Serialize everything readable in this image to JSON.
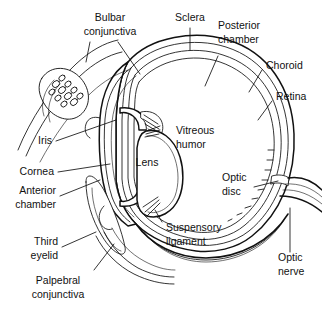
{
  "figure": {
    "type": "anatomical-line-diagram",
    "background_color": "#ffffff",
    "line_color": "#111111",
    "text_color": "#111111"
  },
  "labels": {
    "bulbar_conjunctiva_l1": "Bulbar",
    "bulbar_conjunctiva_l2": "conjunctiva",
    "sclera": "Sclera",
    "posterior_chamber_l1": "Posterior",
    "posterior_chamber_l2": "chamber",
    "choroid": "Choroid",
    "retina": "Retina",
    "iris": "Iris",
    "vitreous_humor_l1": "Vitreous",
    "vitreous_humor_l2": "humor",
    "lens": "Lens",
    "cornea": "Cornea",
    "anterior_chamber_l1": "Anterior",
    "anterior_chamber_l2": "chamber",
    "optic_disc_l1": "Optic",
    "optic_disc_l2": "disc",
    "suspensory_ligament_l1": "Suspensory",
    "suspensory_ligament_l2": "ligament",
    "third_eyelid_l1": "Third",
    "third_eyelid_l2": "eyelid",
    "palpebral_conjunctiva_l1": "Palpebral",
    "palpebral_conjunctiva_l2": "conjunctiva",
    "optic_nerve_l1": "Optic",
    "optic_nerve_l2": "nerve"
  },
  "structures": [
    "bulbar conjunctiva",
    "sclera",
    "posterior chamber",
    "choroid",
    "retina",
    "iris",
    "vitreous humor",
    "lens",
    "cornea",
    "anterior chamber",
    "optic disc",
    "suspensory ligament",
    "third eyelid",
    "palpebral conjunctiva",
    "optic nerve"
  ]
}
